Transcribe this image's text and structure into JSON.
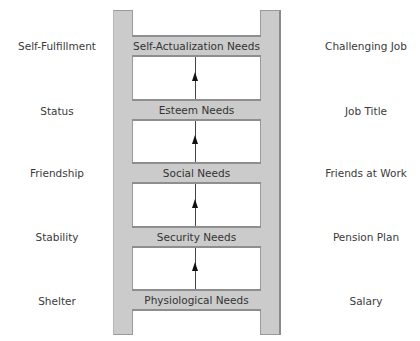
{
  "diagram": {
    "title": "",
    "type": "ladder",
    "colors": {
      "rail_fill": "#cbcbcb",
      "rail_border": "#8e8e8e",
      "text": "#333333",
      "arrow": "#111111"
    },
    "levels": [
      {
        "need": "Self-Actualization Needs",
        "general_example": "Self-Fulfillment",
        "workplace_example": "Challenging Job"
      },
      {
        "need": "Esteem Needs",
        "general_example": "Status",
        "workplace_example": "Job Title"
      },
      {
        "need": "Social Needs",
        "general_example": "Friendship",
        "workplace_example": "Friends at Work"
      },
      {
        "need": "Security Needs",
        "general_example": "Stability",
        "workplace_example": "Pension Plan"
      },
      {
        "need": "Physiological Needs",
        "general_example": "Shelter",
        "workplace_example": "Salary"
      }
    ]
  }
}
